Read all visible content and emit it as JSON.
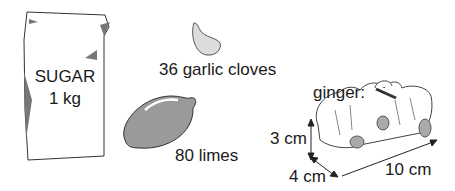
{
  "sugar": {
    "brand": "SUGAR",
    "weight": "1 kg"
  },
  "garlic": {
    "label": "36 garlic cloves"
  },
  "limes": {
    "label": "80 limes"
  },
  "ginger": {
    "title": "ginger:",
    "height": "3 cm",
    "depth": "4 cm",
    "length": "10 cm"
  },
  "colors": {
    "fill_gray": "#9a9a9a",
    "outline": "#333333",
    "light_gray": "#d6d6d6"
  }
}
